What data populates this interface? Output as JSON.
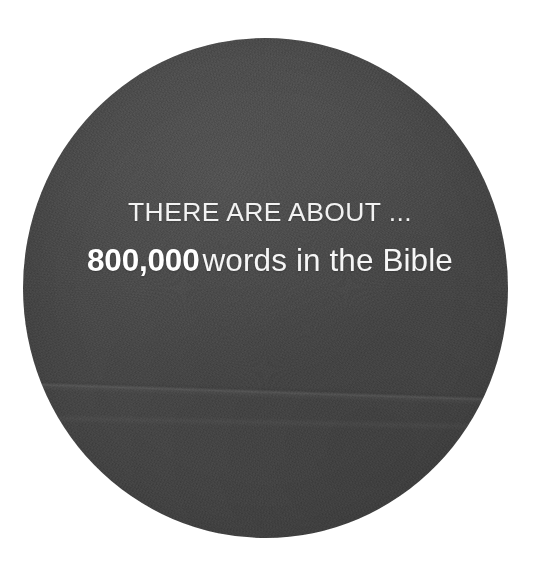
{
  "canvas": {
    "width": 540,
    "height": 576,
    "background_color": "#ffffff"
  },
  "graphic": {
    "shape": "circle",
    "fill_color": "#474747",
    "texture": "paper-grain",
    "center_x": 265,
    "center_y": 288,
    "width": 485,
    "height": 500
  },
  "fact": {
    "lead_line": "THERE ARE ABOUT ...",
    "figure": "800,000",
    "suffix": "words in the Bible",
    "text_color": "#f4f4f4"
  }
}
